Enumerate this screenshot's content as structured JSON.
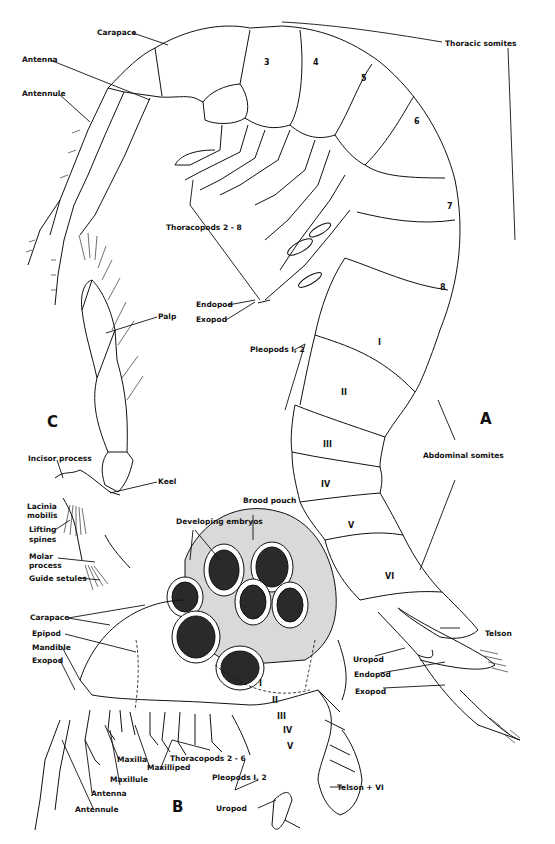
{
  "figure": {
    "panels": [
      {
        "id": "A",
        "label": "A",
        "description": "Whole animal, lateral view"
      },
      {
        "id": "B",
        "label": "B",
        "description": "Brooding female, lateral view"
      },
      {
        "id": "C",
        "label": "C",
        "description": "Mandible with palp"
      }
    ],
    "panel_A": {
      "labels": {
        "carapace": "Carapace",
        "antenna": "Antenna",
        "antennule": "Antennule",
        "thoracic_somites": "Thoracic somites",
        "thoracopods": "Thoracopods 2 - 8",
        "endopod": "Endopod",
        "exopod": "Exopod",
        "pleopods": "Pleopods I, 2",
        "abdominal_somites": "Abdominal somites",
        "telson": "Telson",
        "uropod": "Uropod",
        "uropod_endopod": "Endopod",
        "uropod_exopod": "Exopod"
      },
      "thoracic_numbers": [
        "3",
        "4",
        "5",
        "6",
        "7",
        "8"
      ],
      "abdominal_numbers": [
        "I",
        "II",
        "III",
        "IV",
        "V",
        "VI"
      ]
    },
    "panel_B": {
      "labels": {
        "brood_pouch": "Brood pouch",
        "developing_embryos": "Developing embryos",
        "carapace": "Carapace",
        "epipod": "Epipod",
        "mandible": "Mandible",
        "exopod": "Exopod",
        "maxilla": "Maxilla",
        "maxilliped": "Maxilliped",
        "thoracopods": "Thoracopods 2 - 6",
        "maxillule": "Maxillule",
        "antenna": "Antenna",
        "antennule": "Antennule",
        "pleopods": "Pleopods I, 2",
        "uropod": "Uropod",
        "telson_vi": "Telson + VI"
      },
      "abdominal_numbers": [
        "I",
        "II",
        "III",
        "IV",
        "V"
      ]
    },
    "panel_C": {
      "labels": {
        "palp": "Palp",
        "incisor_process": "Incisor process",
        "keel": "Keel",
        "lacinia_mobilis_1": "Lacinia",
        "lacinia_mobilis_2": "mobilis",
        "lifting_spines_1": "Lifting",
        "lifting_spines_2": "spines",
        "molar_process_1": "Molar",
        "molar_process_2": "process",
        "guide_setules": "Guide setules"
      }
    }
  }
}
